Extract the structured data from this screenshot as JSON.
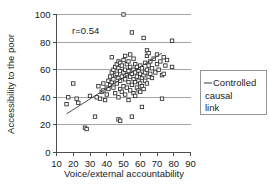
{
  "chart_data": {
    "type": "scatter",
    "title": "",
    "xlabel": "Voice/external accountability",
    "ylabel": "Accessibility to the poor",
    "xlim": [
      10,
      90
    ],
    "ylim": [
      0,
      100
    ],
    "xticks": [
      10,
      20,
      30,
      40,
      50,
      60,
      70,
      80,
      90
    ],
    "yticks": [
      0,
      20,
      40,
      60,
      80,
      100
    ],
    "grid": "horizontal",
    "annotations": [
      {
        "text": "r=0.54",
        "x": 24,
        "y": 90
      }
    ],
    "legend": {
      "position": "right-outside",
      "entries": [
        {
          "label": "Controlled causal link",
          "marker": "line",
          "color": "#3a3a3a"
        }
      ]
    },
    "series": [
      {
        "name": "Countries",
        "marker": "open-square",
        "color": "#2b2b2b",
        "points": [
          [
            16,
            35
          ],
          [
            17,
            40
          ],
          [
            20,
            50
          ],
          [
            22,
            39
          ],
          [
            23,
            36
          ],
          [
            27,
            18
          ],
          [
            28,
            17
          ],
          [
            30,
            41
          ],
          [
            33,
            26
          ],
          [
            34,
            40
          ],
          [
            35,
            48
          ],
          [
            36,
            39
          ],
          [
            37,
            44
          ],
          [
            38,
            45
          ],
          [
            38,
            50
          ],
          [
            39,
            38
          ],
          [
            40,
            42
          ],
          [
            40,
            47
          ],
          [
            41,
            52
          ],
          [
            41,
            46
          ],
          [
            42,
            49
          ],
          [
            42,
            55
          ],
          [
            43,
            58
          ],
          [
            43,
            51
          ],
          [
            43,
            69
          ],
          [
            44,
            47
          ],
          [
            44,
            53
          ],
          [
            44,
            60
          ],
          [
            45,
            43
          ],
          [
            45,
            56
          ],
          [
            45,
            62
          ],
          [
            46,
            50
          ],
          [
            46,
            57
          ],
          [
            46,
            64
          ],
          [
            47,
            24
          ],
          [
            47,
            40
          ],
          [
            47,
            54
          ],
          [
            47,
            61
          ],
          [
            47,
            66
          ],
          [
            48,
            23
          ],
          [
            48,
            46
          ],
          [
            48,
            52
          ],
          [
            48,
            59
          ],
          [
            48,
            65
          ],
          [
            49,
            44
          ],
          [
            49,
            55
          ],
          [
            49,
            63
          ],
          [
            50,
            48
          ],
          [
            50,
            58
          ],
          [
            50,
            100
          ],
          [
            50,
            67
          ],
          [
            51,
            42
          ],
          [
            51,
            53
          ],
          [
            51,
            60
          ],
          [
            51,
            70
          ],
          [
            52,
            47
          ],
          [
            52,
            56
          ],
          [
            52,
            64
          ],
          [
            53,
            38
          ],
          [
            53,
            51
          ],
          [
            53,
            59
          ],
          [
            53,
            66
          ],
          [
            54,
            45
          ],
          [
            54,
            55
          ],
          [
            54,
            62
          ],
          [
            54,
            71
          ],
          [
            55,
            26
          ],
          [
            55,
            49
          ],
          [
            55,
            57
          ],
          [
            55,
            87
          ],
          [
            56,
            43
          ],
          [
            56,
            53
          ],
          [
            56,
            60
          ],
          [
            56,
            68
          ],
          [
            57,
            41
          ],
          [
            57,
            51
          ],
          [
            57,
            58
          ],
          [
            57,
            64
          ],
          [
            58,
            47
          ],
          [
            58,
            55
          ],
          [
            58,
            62
          ],
          [
            59,
            45
          ],
          [
            59,
            52
          ],
          [
            59,
            59
          ],
          [
            60,
            44
          ],
          [
            60,
            50
          ],
          [
            60,
            57
          ],
          [
            60,
            63
          ],
          [
            61,
            33
          ],
          [
            61,
            48
          ],
          [
            61,
            54
          ],
          [
            61,
            61
          ],
          [
            62,
            46
          ],
          [
            62,
            56
          ],
          [
            62,
            83
          ],
          [
            63,
            52
          ],
          [
            63,
            58
          ],
          [
            63,
            65
          ],
          [
            64,
            50
          ],
          [
            64,
            60
          ],
          [
            64,
            70
          ],
          [
            64,
            74
          ],
          [
            65,
            55
          ],
          [
            65,
            63
          ],
          [
            65,
            72
          ],
          [
            66,
            57
          ],
          [
            66,
            66
          ],
          [
            67,
            54
          ],
          [
            67,
            61
          ],
          [
            68,
            68
          ],
          [
            69,
            58
          ],
          [
            70,
            64
          ],
          [
            70,
            71
          ],
          [
            71,
            60
          ],
          [
            72,
            66
          ],
          [
            73,
            39
          ],
          [
            73,
            56
          ],
          [
            74,
            57
          ],
          [
            74,
            69
          ],
          [
            75,
            63
          ],
          [
            76,
            67
          ],
          [
            79,
            62
          ],
          [
            79,
            81
          ]
        ]
      }
    ],
    "trendline": {
      "name": "Controlled causal link",
      "x_start": 16,
      "y_start": 28,
      "x_end": 73,
      "y_end": 72
    }
  }
}
